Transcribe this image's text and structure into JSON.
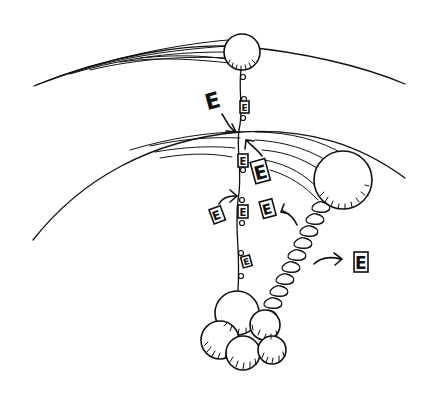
{
  "figure": {
    "labels": {
      "e_top": "E",
      "e_chain_1": "E",
      "e_chain_2": "E",
      "e_chain_3": "E",
      "e_chain_4": "E",
      "e_chain_5": "E",
      "e_mid_right": "E",
      "e_left_small": "E",
      "e_spring_side": "E",
      "e_far_right": "E"
    },
    "colors": {
      "ink": "#111111",
      "background": "#ffffff"
    }
  }
}
